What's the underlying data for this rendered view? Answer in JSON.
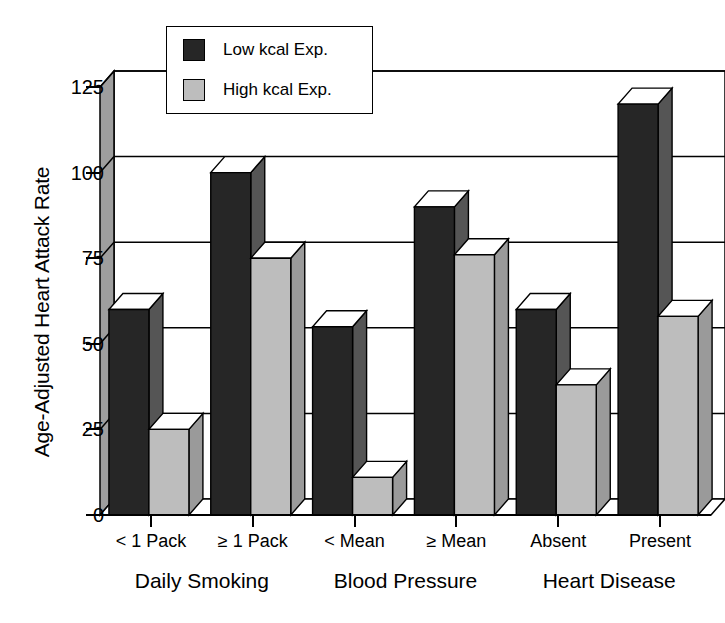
{
  "chart_data": {
    "type": "bar",
    "title": "",
    "subtitle": "",
    "xlabel": "",
    "ylabel": "Age-Adjusted Heart Attack Rate",
    "ylim": [
      0,
      125
    ],
    "yticks": [
      0,
      25,
      50,
      75,
      100,
      125
    ],
    "grid": true,
    "style": "3d-bar",
    "legend_position": "top-left-inside",
    "categories": [
      "< 1 Pack",
      "≥ 1 Pack",
      "< Mean",
      "≥ Mean",
      "Absent",
      "Present"
    ],
    "groups": [
      {
        "name": "Daily Smoking",
        "categories": [
          "< 1 Pack",
          "≥ 1 Pack"
        ]
      },
      {
        "name": "Blood Pressure",
        "categories": [
          "< Mean",
          "≥ Mean"
        ]
      },
      {
        "name": "Heart Disease",
        "categories": [
          "Absent",
          "Present"
        ]
      }
    ],
    "series": [
      {
        "name": "Low kcal Exp.",
        "color": "#262626",
        "values": [
          60,
          100,
          55,
          90,
          60,
          120
        ]
      },
      {
        "name": "High kcal Exp.",
        "color": "#bdbdbd",
        "values": [
          25,
          75,
          11,
          76,
          38,
          58
        ]
      }
    ]
  },
  "legend": {
    "entries": [
      {
        "label": "Low kcal Exp.",
        "color": "#262626"
      },
      {
        "label": "High kcal Exp.",
        "color": "#bdbdbd"
      }
    ]
  },
  "axes": {
    "y_title": "Age-Adjusted Heart Attack Rate",
    "y_ticks": [
      "0",
      "25",
      "50",
      "75",
      "100",
      "125"
    ],
    "x_tick_labels": [
      "< 1 Pack",
      "≥ 1 Pack",
      "< Mean",
      "≥ Mean",
      "Absent",
      "Present"
    ],
    "group_labels": [
      "Daily Smoking",
      "Blood Pressure",
      "Heart Disease"
    ]
  },
  "colors": {
    "low_kcal": "#262626",
    "high_kcal": "#bdbdbd",
    "axis": "#000000",
    "background": "#ffffff",
    "bar_side_dark": "#555555",
    "bar_side_light": "#9a9a9a",
    "bar_top_dark": "#ffffff",
    "bar_top_light": "#ffffff"
  }
}
